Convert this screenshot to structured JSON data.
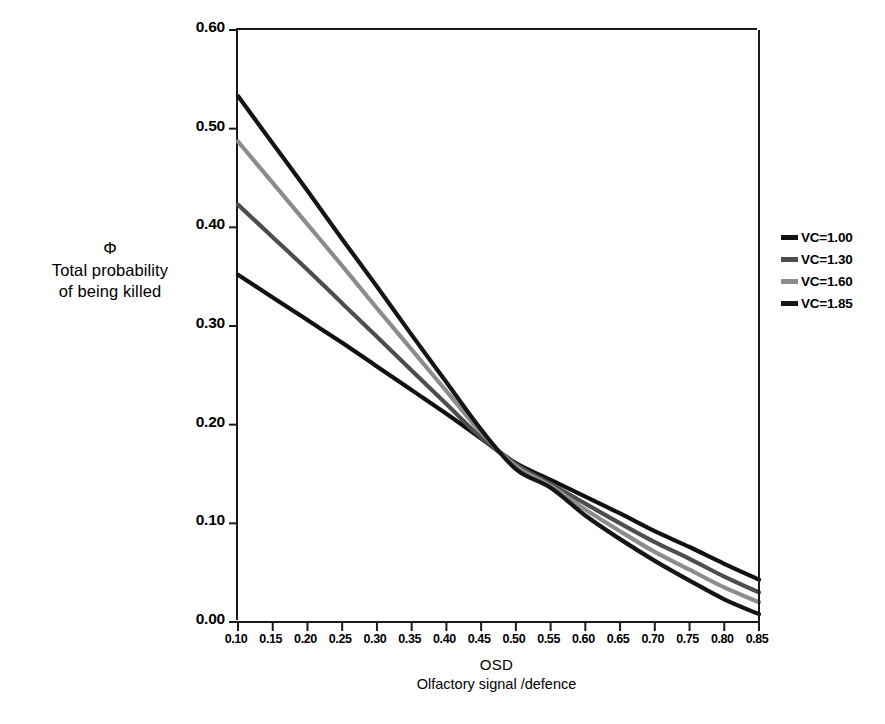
{
  "chart_data": {
    "type": "line",
    "title": "",
    "xlabel": "OSD",
    "xlabel_sub": "Olfactory signal /defence",
    "ylabel_symbol": "Φ",
    "ylabel_line1": "Total probability",
    "ylabel_line2": "of being killed",
    "xlim": [
      0.1,
      0.85
    ],
    "ylim": [
      0.0,
      0.6
    ],
    "grid": false,
    "legend_position": "right",
    "x_ticks": [
      "0.10",
      "0.15",
      "0.20",
      "0.25",
      "0.30",
      "0.35",
      "0.40",
      "0.45",
      "0.50",
      "0.55",
      "0.60",
      "0.65",
      "0.70",
      "0.75",
      "0.80",
      "0.85"
    ],
    "y_ticks": [
      "0.00",
      "0.10",
      "0.20",
      "0.30",
      "0.40",
      "0.50",
      "0.60"
    ],
    "x": [
      0.1,
      0.15,
      0.2,
      0.25,
      0.3,
      0.35,
      0.4,
      0.45,
      0.5,
      0.55,
      0.6,
      0.65,
      0.7,
      0.75,
      0.8,
      0.85
    ],
    "series": [
      {
        "name": "VC=1.00",
        "color": "#111111",
        "values": [
          0.352,
          0.329,
          0.306,
          0.283,
          0.259,
          0.235,
          0.211,
          0.186,
          0.161,
          0.144,
          0.127,
          0.11,
          0.092,
          0.076,
          0.059,
          0.043
        ]
      },
      {
        "name": "VC=1.30",
        "color": "#4d4d4d",
        "values": [
          0.423,
          0.39,
          0.357,
          0.323,
          0.289,
          0.255,
          0.221,
          0.187,
          0.16,
          0.14,
          0.12,
          0.1,
          0.081,
          0.064,
          0.046,
          0.03
        ]
      },
      {
        "name": "VC=1.60",
        "color": "#8c8c8c",
        "values": [
          0.487,
          0.445,
          0.403,
          0.361,
          0.318,
          0.276,
          0.234,
          0.192,
          0.158,
          0.138,
          0.114,
          0.092,
          0.071,
          0.053,
          0.035,
          0.02
        ]
      },
      {
        "name": "VC=1.85",
        "color": "#151515",
        "values": [
          0.533,
          0.485,
          0.437,
          0.388,
          0.34,
          0.291,
          0.243,
          0.195,
          0.155,
          0.136,
          0.108,
          0.084,
          0.062,
          0.042,
          0.023,
          0.008
        ]
      }
    ]
  },
  "legend": {
    "items": [
      {
        "label": "VC=1.00"
      },
      {
        "label": "VC=1.30"
      },
      {
        "label": "VC=1.60"
      },
      {
        "label": "VC=1.85"
      }
    ]
  },
  "caption": {
    "remnant": ""
  }
}
